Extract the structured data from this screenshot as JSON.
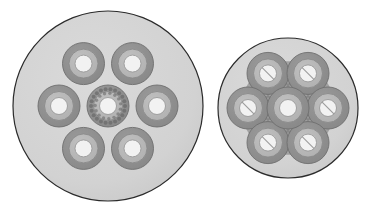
{
  "figure": {
    "title": "Two circular bundle cross-sections",
    "background_color": "#ffffff",
    "width": 375,
    "height": 213
  },
  "palette": {
    "disc_fill": "#d3d3d3",
    "disc_stroke": "#2b2b2b",
    "ring_outer_fill": "#8f8f8f",
    "ring_outer_stroke": "#6e6e6e",
    "ring_mid_fill": "#b6b6b6",
    "ring_mid_stroke": "#8a8a8a",
    "ring_core_fill": "#f2f2f2",
    "ring_core_stroke": "#9a9a9a",
    "overlap_fill": "#7a7a7a",
    "speckle_fill": "#6b6b6b",
    "slot_stroke": "#9a9a9a"
  },
  "discs": [
    {
      "id": "left-disc",
      "label": "Left cross-section",
      "cx": 108,
      "cy": 106,
      "r": 95,
      "ring_count": 7,
      "packing": "hexagonal-spaced",
      "orbit_radius": 49,
      "ring_outer_r": 21,
      "ring_mid_r": 14.5,
      "ring_core_r": 8.5,
      "center_ring": {
        "id": "left-center-ring",
        "label": "Center ring with speckled band",
        "cx": 108,
        "cy": 106,
        "speckled": true,
        "slotted": false,
        "speckle_count": 22,
        "speckle_ring_r": 17,
        "speckle_dot_r": 2.0
      },
      "satellite_rings": [
        {
          "id": "left-ring-1",
          "label": "Upper-left ring",
          "cx": 83.5,
          "cy": 63.6,
          "slotted": false
        },
        {
          "id": "left-ring-2",
          "label": "Upper-right ring",
          "cx": 132.5,
          "cy": 63.6,
          "slotted": false
        },
        {
          "id": "left-ring-3",
          "label": "Left ring",
          "cx": 59.0,
          "cy": 106.0,
          "slotted": false
        },
        {
          "id": "left-ring-4",
          "label": "Right ring",
          "cx": 157.0,
          "cy": 106.0,
          "slotted": false
        },
        {
          "id": "left-ring-5",
          "label": "Lower-left ring",
          "cx": 83.5,
          "cy": 148.4,
          "slotted": false
        },
        {
          "id": "left-ring-6",
          "label": "Lower-right ring",
          "cx": 132.5,
          "cy": 148.4,
          "slotted": false
        }
      ]
    },
    {
      "id": "right-disc",
      "label": "Right cross-section",
      "cx": 288,
      "cy": 108,
      "r": 70,
      "ring_count": 7,
      "packing": "hexagonal-close",
      "orbit_radius": 40,
      "ring_outer_r": 21,
      "ring_mid_r": 14.5,
      "ring_core_r": 8.5,
      "center_ring": {
        "id": "right-center-ring",
        "label": "Center ring",
        "cx": 288,
        "cy": 108,
        "speckled": false,
        "slotted": false
      },
      "satellite_rings": [
        {
          "id": "right-ring-1",
          "label": "Upper-left ring",
          "cx": 268.0,
          "cy": 73.4,
          "slotted": true
        },
        {
          "id": "right-ring-2",
          "label": "Upper-right ring",
          "cx": 308.0,
          "cy": 73.4,
          "slotted": true
        },
        {
          "id": "right-ring-3",
          "label": "Left ring",
          "cx": 248.0,
          "cy": 108.0,
          "slotted": true
        },
        {
          "id": "right-ring-4",
          "label": "Right ring",
          "cx": 328.0,
          "cy": 108.0,
          "slotted": true
        },
        {
          "id": "right-ring-5",
          "label": "Lower-left ring",
          "cx": 268.0,
          "cy": 142.6,
          "slotted": true
        },
        {
          "id": "right-ring-6",
          "label": "Lower-right ring",
          "cx": 308.0,
          "cy": 142.6,
          "slotted": true
        }
      ]
    }
  ]
}
